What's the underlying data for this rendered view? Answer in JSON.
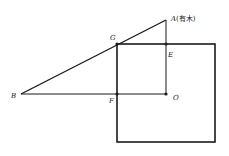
{
  "diagram": {
    "type": "geometry",
    "colors": {
      "stroke": "#1a1a1a",
      "background": "#ffffff"
    },
    "points": {
      "A": {
        "label": "A",
        "note": "(有木)",
        "x": 166,
        "y": 20
      },
      "G": {
        "label": "G",
        "x": 117,
        "y": 44
      },
      "E": {
        "label": "E",
        "x": 166,
        "y": 44
      },
      "B": {
        "label": "B",
        "x": 21,
        "y": 94
      },
      "F": {
        "label": "F",
        "x": 117,
        "y": 94
      },
      "O": {
        "label": "O",
        "x": 166,
        "y": 94
      }
    },
    "square": {
      "x": 117,
      "y": 44,
      "width": 98,
      "height": 98
    },
    "segments": [
      [
        "B",
        "A"
      ],
      [
        "A",
        "O"
      ],
      [
        "B",
        "O"
      ]
    ]
  }
}
